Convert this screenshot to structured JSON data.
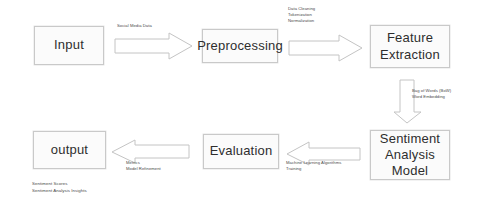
{
  "diagram": {
    "colors": {
      "node_fill": "#fbfbfb",
      "node_border": "#c9c9c9",
      "arrow_fill": "#ffffff",
      "arrow_border": "#c4c4c4",
      "text": "#2e2e2e",
      "label_text": "#4a4a4a",
      "background": "#ffffff"
    },
    "nodes": [
      {
        "id": "input",
        "label": "Input"
      },
      {
        "id": "preprocessing",
        "label": "Preprocessing"
      },
      {
        "id": "feature_extraction",
        "label": "Feature\nExtraction"
      },
      {
        "id": "sentiment_model",
        "label": "Sentiment\nAnalysis\nModel"
      },
      {
        "id": "evaluation",
        "label": "Evaluation"
      },
      {
        "id": "output",
        "label": "output"
      }
    ],
    "edges": [
      {
        "id": "input-to-preprocessing",
        "direction": "right",
        "label": "Social Media Data"
      },
      {
        "id": "preprocessing-to-feature-extraction",
        "direction": "right",
        "label": "Data Cleaning\nTokenization\nNormalization"
      },
      {
        "id": "feature-extraction-to-model",
        "direction": "down",
        "label": "Bag of Words (BoW)\nWord Embedding"
      },
      {
        "id": "model-to-evaluation",
        "direction": "left",
        "label": "Machine Learning Algorithms\nTraining"
      },
      {
        "id": "evaluation-to-output",
        "direction": "left",
        "label": "Metrics\nModel Refinement"
      }
    ],
    "caption": "Sentiment Scores\nSentiment Analysis Insights"
  }
}
